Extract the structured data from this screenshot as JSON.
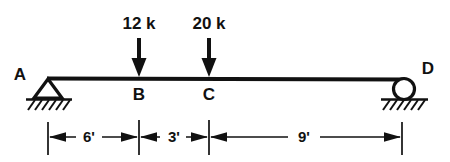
{
  "diagram": {
    "type": "simply-supported-beam-free-body-diagram",
    "beam": {
      "left_label": "A",
      "right_label": "D",
      "interior_labels": [
        "B",
        "C"
      ]
    },
    "loads": [
      {
        "label": "12 k",
        "magnitude": 12,
        "unit": "k",
        "at_point": "B",
        "direction": "down"
      },
      {
        "label": "20 k",
        "magnitude": 20,
        "unit": "k",
        "at_point": "C",
        "direction": "down"
      }
    ],
    "supports": [
      {
        "at_point": "A",
        "kind": "pin-support",
        "icon": "triangle-hatch-icon"
      },
      {
        "at_point": "D",
        "kind": "roller-support",
        "icon": "circle-roller-hatch-icon"
      }
    ],
    "dimensions": [
      {
        "label": "6'",
        "value": 6,
        "unit": "ft",
        "from": "A",
        "to": "B"
      },
      {
        "label": "3'",
        "value": 3,
        "unit": "ft",
        "from": "B",
        "to": "C"
      },
      {
        "label": "9'",
        "value": 9,
        "unit": "ft",
        "from": "C",
        "to": "D"
      }
    ],
    "total_span": {
      "value": 18,
      "unit": "ft"
    },
    "colors": {
      "ink": "#111111",
      "background": "#ffffff"
    }
  }
}
